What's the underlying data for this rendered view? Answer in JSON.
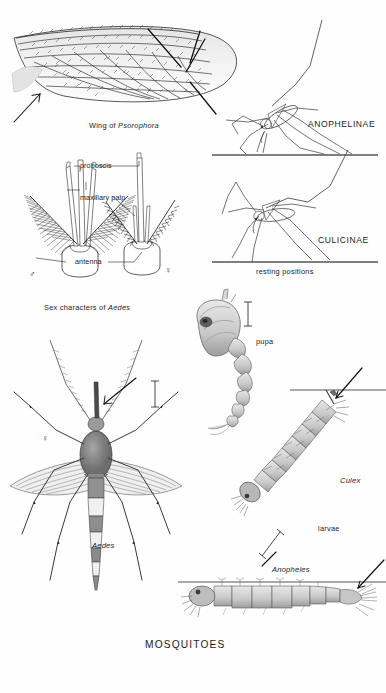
{
  "plate": {
    "title": "MOSQUITOES",
    "background_color": "#fefefe",
    "ink_color": "#1a1a1a"
  },
  "figures": {
    "wing": {
      "caption_prefix": "Wing of ",
      "caption_taxon": "Psorophora",
      "caption_full": "Wing of Psorophora"
    },
    "head_structures": {
      "caption_prefix": "Sex characters of ",
      "caption_taxon": "Aedes",
      "caption_full": "Sex characters of Aedes",
      "labels": [
        "proboscis",
        "maxillary palp",
        "antenna"
      ],
      "male_symbol": "♂",
      "female_symbol": "♀"
    },
    "resting_positions": {
      "caption": "resting positions",
      "items": [
        {
          "label": "ANOPHELINAE"
        },
        {
          "label": "CULICINAE"
        }
      ]
    },
    "pupa": {
      "label": "pupa"
    },
    "adult": {
      "taxon": "Aedes",
      "female_symbol": "♀"
    },
    "larvae": {
      "group_label": "larvae",
      "items": [
        {
          "label": "Culex"
        },
        {
          "label": "Anopheles"
        }
      ]
    }
  }
}
